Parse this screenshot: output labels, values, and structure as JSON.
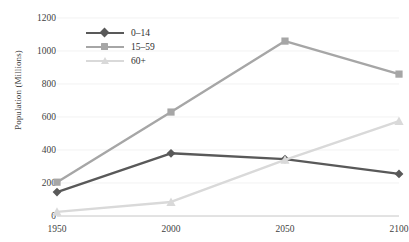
{
  "chart_data": {
    "type": "line",
    "title": "",
    "xlabel": "",
    "ylabel": "Population (Millions)",
    "categories": [
      "1950",
      "2000",
      "2050",
      "2100"
    ],
    "x": [
      1950,
      2000,
      2050,
      2100
    ],
    "xlim": [
      1950,
      2100
    ],
    "ylim": [
      0,
      1200
    ],
    "yticks": [
      0,
      200,
      400,
      600,
      800,
      1000,
      1200
    ],
    "ytick_labels": [
      "0",
      "200",
      "400",
      "600",
      "800",
      "1000",
      "1200"
    ],
    "grid": true,
    "legend_position": "upper-left-inside",
    "series": [
      {
        "name": "0–14",
        "values": [
          145,
          380,
          345,
          255
        ],
        "color": "#595959",
        "marker": "diamond"
      },
      {
        "name": "15–59",
        "values": [
          205,
          630,
          1060,
          860
        ],
        "color": "#a6a6a6",
        "marker": "square"
      },
      {
        "name": "60+",
        "values": [
          25,
          85,
          340,
          575
        ],
        "color": "#d9d9d9",
        "marker": "triangle"
      }
    ]
  },
  "axes": {
    "y_title": "Population (Millions)"
  },
  "colors": {
    "series_0_14": "#595959",
    "series_15_59": "#a6a6a6",
    "series_60_plus": "#d9d9d9",
    "grid": "#ededed",
    "axis": "#bfbfbf",
    "text": "#3f3f3f",
    "background": "#ffffff"
  }
}
